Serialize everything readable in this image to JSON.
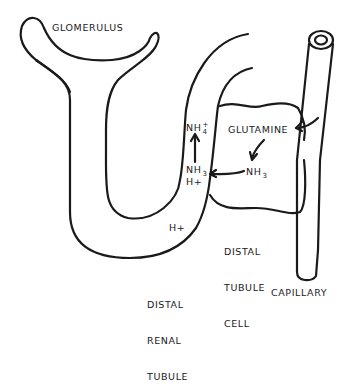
{
  "diagram": {
    "labels": {
      "glomerulus": "GLOMERULUS",
      "glutamine": "GLUTAMINE",
      "nh4_base": "NH",
      "nh4_sub": "4",
      "nh4_sup": "+",
      "nh3_lumen_base": "NH",
      "nh3_lumen_sub": "3",
      "h_plus_lumen": "H+",
      "nh3_cell_base": "NH",
      "nh3_cell_sub": "3",
      "h_plus_tubule": "H+",
      "distal_tubule_cell": [
        "DISTAL",
        "TUBULE",
        "CELL"
      ],
      "distal_renal_tubule": [
        "DISTAL",
        "RENAL",
        "TUBULE"
      ],
      "capillary": "CAPILLARY"
    },
    "colors": {
      "line": "#1a1a1a",
      "background": "#ffffff"
    }
  }
}
